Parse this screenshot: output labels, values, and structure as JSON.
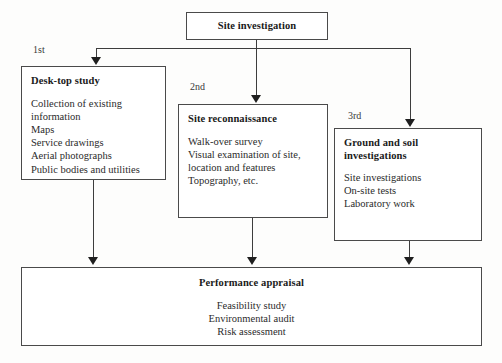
{
  "diagram": {
    "title_box": {
      "label": "Site investigation"
    },
    "ordinals": {
      "first": "1st",
      "second": "2nd",
      "third": "3rd"
    },
    "stages": [
      {
        "id": "desk-top-study",
        "order_label": "1st",
        "title": "Desk-top study",
        "items_text": "Collection of existing\ninformation\nMaps\nService drawings\nAerial photographs\nPublic bodies and utilities",
        "items": [
          "Collection of existing information",
          "Maps",
          "Service drawings",
          "Aerial photographs",
          "Public bodies and utilities"
        ]
      },
      {
        "id": "site-reconnaissance",
        "order_label": "2nd",
        "title": "Site reconnaissance",
        "items_text": "Walk-over survey\nVisual examination of site,\nlocation and features\nTopography, etc.",
        "items": [
          "Walk-over survey",
          "Visual examination of site, location and features",
          "Topography, etc."
        ]
      },
      {
        "id": "ground-and-soil-investigations",
        "order_label": "3rd",
        "title": "Ground and soil\ninvestigations",
        "items_text": "Site investigations\nOn-site tests\nLaboratory work",
        "items": [
          "Site investigations",
          "On-site tests",
          "Laboratory work"
        ]
      }
    ],
    "outcome_box": {
      "title": "Performance appraisal",
      "items_text": "Feasibility study\nEnvironmental audit\nRisk assessment",
      "items": [
        "Feasibility study",
        "Environmental audit",
        "Risk assessment"
      ]
    },
    "colors": {
      "border": "#4a4a4a",
      "text": "#2b2b2b",
      "heading": "#1a1a1a",
      "connector": "#3d3d3d",
      "background": "#fdfdfc"
    }
  }
}
